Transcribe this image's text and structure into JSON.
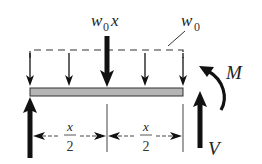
{
  "diagram": {
    "type": "free-body diagram of beam segment",
    "labels": {
      "resultant_load": "w0x",
      "resultant_load_base": "w",
      "resultant_load_sub": "0",
      "resultant_load_var": "x",
      "distributed_load_base": "w",
      "distributed_load_sub": "0",
      "moment": "M",
      "shear": "V",
      "half_length_num": "x",
      "half_length_den": "2"
    },
    "colors": {
      "ink": "#111111",
      "beam_fill": "#b5b5b5",
      "beam_stroke": "#333333",
      "dim_line": "#444444"
    },
    "elements": [
      "dashed distributed load line",
      "4 small downward load arrows",
      "large resultant arrow at midpoint",
      "beam",
      "left upward reaction arrow",
      "right upward shear arrow V",
      "counterclockwise moment arrow M",
      "two dimension spans each x/2"
    ]
  }
}
